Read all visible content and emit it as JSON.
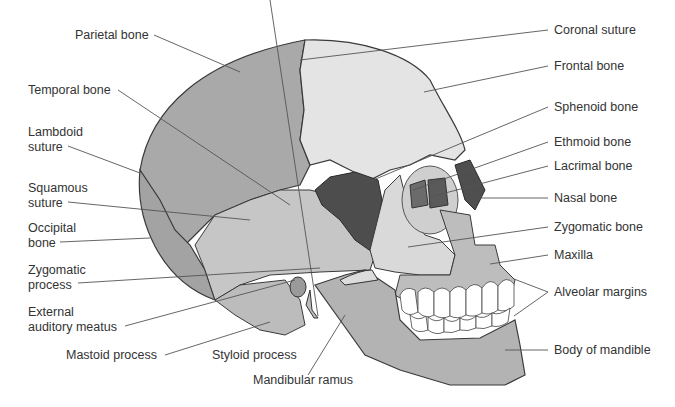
{
  "diagram": {
    "colors": {
      "parietal": "#a9a9a9",
      "frontal": "#e4e4e4",
      "temporal": "#c6c6c6",
      "occipital": "#a3a3a3",
      "sphenoid": "#4d4d4d",
      "ethmoid": "#6b6b6b",
      "lacrimal": "#5a5a5a",
      "nasal": "#4f4f4f",
      "zygomatic": "#d9d9d9",
      "maxilla": "#bdbdbd",
      "mandible": "#b3b3b3",
      "teeth": "#ffffff",
      "outline": "#3a3a3a",
      "leader": "#555555"
    },
    "labels_left": [
      {
        "text": "Parietal bone"
      },
      {
        "text": "Temporal bone"
      },
      {
        "text": "Lambdoid",
        "text2": "suture"
      },
      {
        "text": "Squamous",
        "text2": "suture"
      },
      {
        "text": "Occipital",
        "text2": "bone"
      },
      {
        "text": "Zygomatic",
        "text2": "process"
      },
      {
        "text": "External",
        "text2": "auditory meatus"
      },
      {
        "text": "Mastoid process"
      }
    ],
    "labels_bottom": [
      {
        "text": "Styloid process"
      },
      {
        "text": "Mandibular ramus"
      }
    ],
    "labels_right": [
      {
        "text": "Coronal suture"
      },
      {
        "text": "Frontal bone"
      },
      {
        "text": "Sphenoid bone"
      },
      {
        "text": "Ethmoid bone"
      },
      {
        "text": "Lacrimal bone"
      },
      {
        "text": "Nasal bone"
      },
      {
        "text": "Zygomatic bone"
      },
      {
        "text": "Maxilla"
      },
      {
        "text": "Alveolar margins"
      },
      {
        "text": "Body of mandible"
      }
    ]
  }
}
